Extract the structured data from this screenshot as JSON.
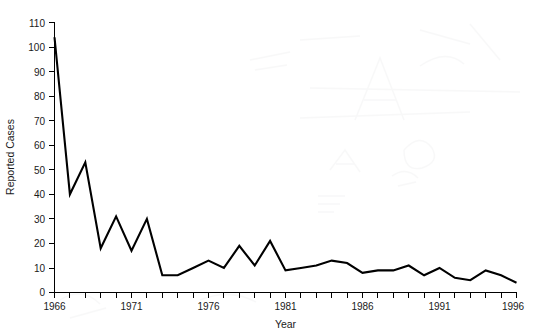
{
  "chart_data": {
    "type": "line",
    "title": "",
    "xlabel": "Year",
    "ylabel": "Reported Cases",
    "xlim": [
      1966,
      1996
    ],
    "ylim": [
      0,
      110
    ],
    "grid": false,
    "legend": null,
    "x_tick_labels": [
      "1966",
      "1971",
      "1976",
      "1981",
      "1986",
      "1991",
      "1996"
    ],
    "x_tick_values": [
      1966,
      1971,
      1976,
      1981,
      1986,
      1991,
      1996
    ],
    "x_minor_tick_interval": 1,
    "y_tick_labels": [
      "0",
      "10",
      "20",
      "30",
      "40",
      "50",
      "60",
      "70",
      "80",
      "90",
      "100",
      "110"
    ],
    "y_tick_values": [
      0,
      10,
      20,
      30,
      40,
      50,
      60,
      70,
      80,
      90,
      100,
      110
    ],
    "line_color": "#000000",
    "x": [
      1966,
      1967,
      1968,
      1969,
      1970,
      1971,
      1972,
      1973,
      1974,
      1975,
      1976,
      1977,
      1978,
      1979,
      1980,
      1981,
      1982,
      1983,
      1984,
      1985,
      1986,
      1987,
      1988,
      1989,
      1990,
      1991,
      1992,
      1993,
      1994,
      1995,
      1996
    ],
    "values": [
      104,
      40,
      53,
      18,
      31,
      17,
      30,
      7,
      7,
      10,
      13,
      10,
      19,
      11,
      21,
      9,
      10,
      11,
      13,
      12,
      8,
      9,
      9,
      11,
      7,
      10,
      6,
      5,
      9,
      7,
      4
    ],
    "series": [
      {
        "name": "Reported Cases",
        "values": [
          104,
          40,
          53,
          18,
          31,
          17,
          30,
          7,
          7,
          10,
          13,
          10,
          19,
          11,
          21,
          9,
          10,
          11,
          13,
          12,
          8,
          9,
          9,
          11,
          7,
          10,
          6,
          5,
          9,
          7,
          4
        ]
      }
    ]
  },
  "axes": {
    "x_title": "Year",
    "y_title": "Reported Cases"
  }
}
